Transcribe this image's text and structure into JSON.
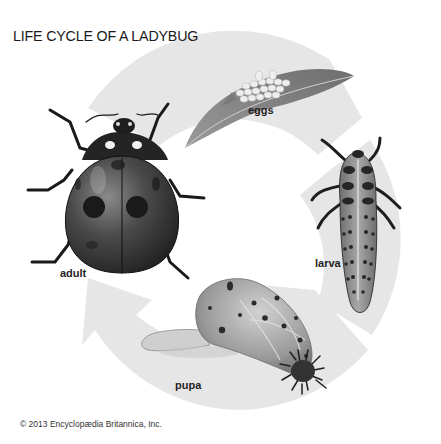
{
  "title": "LIFE CYCLE OF A LADYBUG",
  "stages": [
    {
      "id": "eggs",
      "label": "eggs"
    },
    {
      "id": "larva",
      "label": "larva"
    },
    {
      "id": "pupa",
      "label": "pupa"
    },
    {
      "id": "adult",
      "label": "adult"
    }
  ],
  "copyright": "© 2013 Encyclopædia Britannica, Inc.",
  "colors": {
    "ring": "#e6e6e6",
    "background": "#ffffff",
    "text": "#1f1f1f"
  }
}
